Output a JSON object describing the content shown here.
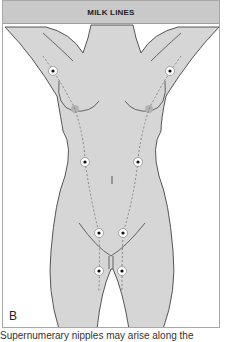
{
  "figure": {
    "title": "MILK LINES",
    "panel_label": "B",
    "caption_partial": "Supernumerary nipples may arise along the",
    "colors": {
      "header_bg": "#c9c9c9",
      "body_fill": "#d6d6d6",
      "outline": "#555555",
      "nipple": "#b0b0b0",
      "marker_fill": "#ffffff",
      "marker_dot": "#111111"
    },
    "markers": [
      {
        "name": "left-axilla",
        "x": 52,
        "y": 70
      },
      {
        "name": "right-axilla",
        "x": 169,
        "y": 70
      },
      {
        "name": "left-abdomen",
        "x": 84,
        "y": 161
      },
      {
        "name": "right-abdomen",
        "x": 137,
        "y": 161
      },
      {
        "name": "left-groin",
        "x": 98,
        "y": 232
      },
      {
        "name": "right-groin",
        "x": 122,
        "y": 232
      },
      {
        "name": "left-thigh",
        "x": 98,
        "y": 270
      },
      {
        "name": "right-thigh",
        "x": 121,
        "y": 270
      }
    ]
  }
}
